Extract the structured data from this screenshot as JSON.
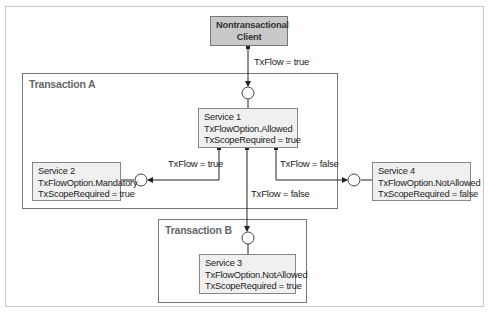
{
  "diagram": {
    "client": {
      "line1": "Nontransactional",
      "line2": "Client"
    },
    "transaction_a": {
      "label": "Transaction A"
    },
    "transaction_b": {
      "label": "Transaction B"
    },
    "service1": {
      "name": "Service 1",
      "option": "TxFlowOption.Allowed",
      "scope": "TxScopeRequired = true"
    },
    "service2": {
      "name": "Service 2",
      "option": "TxFlowOption.Mandatory",
      "scope": "TxScopeRequired = true"
    },
    "service3": {
      "name": "Service 3",
      "option": "TxFlowOption.NotAllowed",
      "scope": "TxScopeRequired = true"
    },
    "service4": {
      "name": "Service 4",
      "option": "TxFlowOption.NotAllowed",
      "scope": "TxScopeRequired = false"
    },
    "edges": {
      "client_to_s1": "TxFlow = true",
      "s1_to_s2": "TxFlow = true",
      "s1_to_s4": "TxFlow = false",
      "s1_to_s3": "TxFlow = false"
    },
    "colors": {
      "client_fill": "#c9c9c9",
      "service_fill": "#f0f0f0",
      "box_border": "#777777",
      "line": "#222222"
    }
  }
}
